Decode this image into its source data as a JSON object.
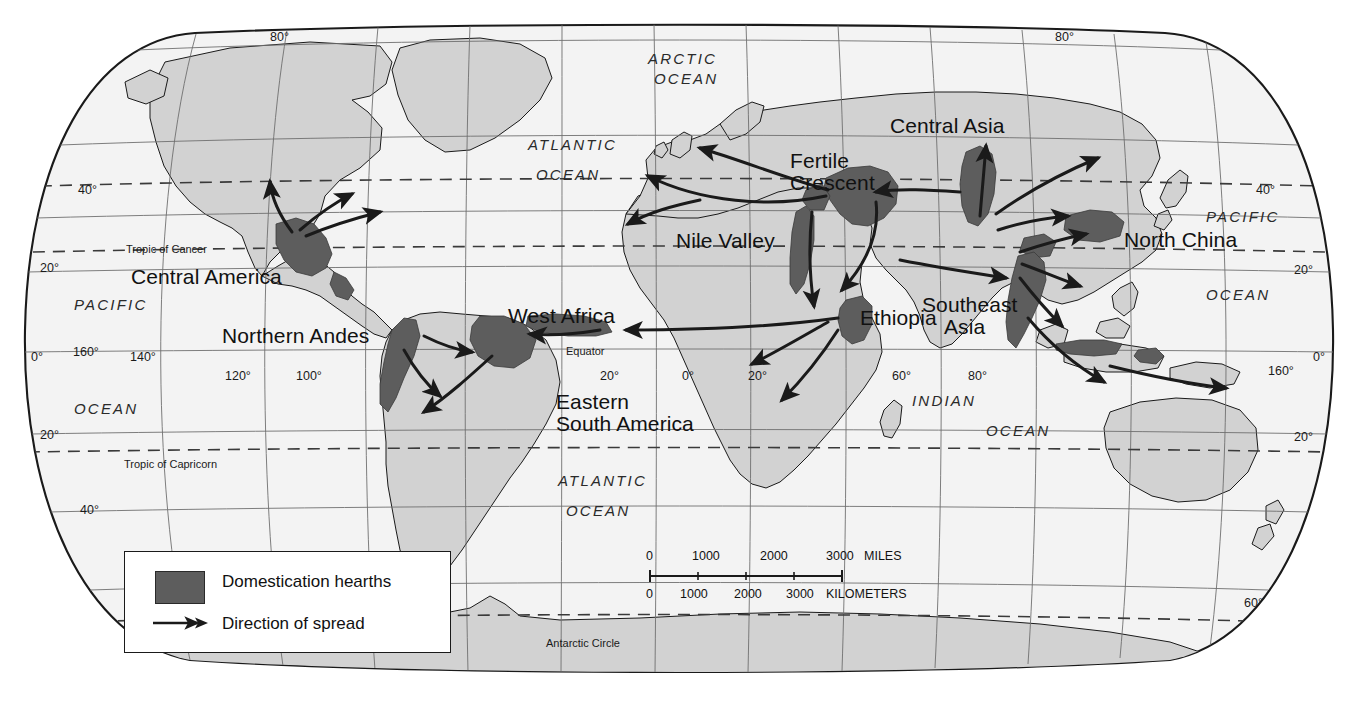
{
  "map": {
    "title": "World map of agricultural domestication hearths",
    "projection": "Robinson",
    "colors": {
      "ocean": "#f3f3f3",
      "land": "#d2d2d2",
      "hearth": "#5d5d5d",
      "graticule": "#6f6f6f",
      "coastline": "#1a1a1a",
      "dashed_line": "#3a3a3a",
      "text": "#111111"
    }
  },
  "regions": [
    {
      "name": "Central America",
      "line1": "Central America",
      "line2": ""
    },
    {
      "name": "Northern Andes",
      "line1": "Northern Andes",
      "line2": ""
    },
    {
      "name": "Eastern South America",
      "line1": "Eastern",
      "line2": "South America"
    },
    {
      "name": "West Africa",
      "line1": "West Africa",
      "line2": ""
    },
    {
      "name": "Nile Valley",
      "line1": "Nile Valley",
      "line2": ""
    },
    {
      "name": "Ethiopia",
      "line1": "Ethiopia",
      "line2": ""
    },
    {
      "name": "Fertile Crescent",
      "line1": "Fertile",
      "line2": "Crescent"
    },
    {
      "name": "Central Asia",
      "line1": "Central Asia",
      "line2": ""
    },
    {
      "name": "North China",
      "line1": "North China",
      "line2": ""
    },
    {
      "name": "Southeast Asia",
      "line1": "Southeast",
      "line2": "Asia"
    }
  ],
  "oceans": [
    {
      "line1": "ARCTIC",
      "line2": "OCEAN"
    },
    {
      "line1": "ATLANTIC",
      "line2": "OCEAN"
    },
    {
      "line1": "PACIFIC",
      "line2": "OCEAN"
    },
    {
      "line1": "ATLANTIC",
      "line2": "OCEAN"
    },
    {
      "line1": "INDIAN",
      "line2": "OCEAN"
    },
    {
      "line1": "PACIFIC",
      "line2": "OCEAN"
    }
  ],
  "special_lines": [
    {
      "label": "Tropic of Cancer"
    },
    {
      "label": "Equator"
    },
    {
      "label": "Tropic of Capricorn"
    },
    {
      "label": "Antarctic Circle"
    }
  ],
  "graticule_labels": {
    "latitudes_left": [
      "80°",
      "40°",
      "20°",
      "0°",
      "20°",
      "40°"
    ],
    "latitudes_right": [
      "80°",
      "40°",
      "20°",
      "0°",
      "20°",
      "60°"
    ],
    "longitudes_west": [
      "160°",
      "140°",
      "120°",
      "100°"
    ],
    "longitudes_east": [
      "20°",
      "0°",
      "20°",
      "60°",
      "80°",
      "160°"
    ]
  },
  "legend": {
    "hearth_label": "Domestication hearths",
    "spread_label": "Direction of spread"
  },
  "scale": {
    "miles": {
      "ticks": [
        "0",
        "1000",
        "2000",
        "3000"
      ],
      "unit": "MILES"
    },
    "kilometers": {
      "ticks": [
        "0",
        "1000",
        "2000",
        "3000"
      ],
      "unit": "KILOMETERS"
    }
  }
}
